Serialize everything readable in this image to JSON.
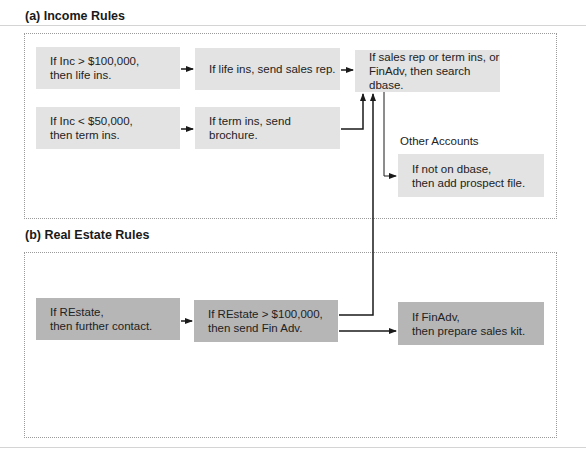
{
  "sections": {
    "income": {
      "title": "(a) Income Rules"
    },
    "real_estate": {
      "title": "(b) Real Estate Rules"
    }
  },
  "income_rules": [
    {
      "id": "inc-high",
      "line1": "If Inc > $100,000,",
      "line2": "then life ins."
    },
    {
      "id": "life-ins",
      "line1": "If life ins, send sales rep.",
      "line2": ""
    },
    {
      "id": "search-dbase",
      "line1": "If sales rep or term ins, or",
      "line2": "FinAdv, then search dbase."
    },
    {
      "id": "inc-low",
      "line1": "If Inc < $50,000,",
      "line2": "then term ins."
    },
    {
      "id": "term-ins",
      "line1": "If term ins, send brochure.",
      "line2": ""
    },
    {
      "id": "add-prospect",
      "line1": "If not on dbase,",
      "line2": "then add prospect file."
    }
  ],
  "other_accounts_label": "Other Accounts",
  "real_estate_rules": [
    {
      "id": "restate",
      "line1": "If REstate,",
      "line2": "then further contact."
    },
    {
      "id": "restate-high",
      "line1": "If REstate > $100,000,",
      "line2": "then send Fin Adv."
    },
    {
      "id": "finadv",
      "line1": "If FinAdv,",
      "line2": "then prepare sales kit."
    }
  ],
  "colors": {
    "light_box": "#e3e3e3",
    "dark_box": "#b6b6b6",
    "line": "#1a1a1a",
    "dotted_border": "#9a9a9a"
  }
}
